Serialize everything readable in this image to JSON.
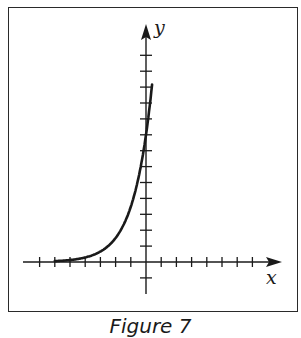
{
  "figure": {
    "caption": "Figure 7",
    "x_axis_label": "x",
    "y_axis_label": "y"
  },
  "colors": {
    "ink": "#1a1a1a",
    "frame": "#2a2a2a",
    "background": "#ffffff"
  },
  "chart_data": {
    "type": "line",
    "title": "",
    "caption": "Figure 7",
    "xlabel": "x",
    "ylabel": "y",
    "xlim": [
      -7,
      7
    ],
    "ylim": [
      -1,
      13
    ],
    "x_ticks": [
      -7,
      -6,
      -5,
      -4,
      -3,
      -2,
      -1,
      1,
      2,
      3,
      4,
      5,
      6,
      7
    ],
    "y_ticks": [
      -1,
      1,
      2,
      3,
      4,
      5,
      6,
      7,
      8,
      9,
      10,
      11,
      12,
      13
    ],
    "tick_labels_shown": false,
    "grid": false,
    "legend": null,
    "series": [
      {
        "name": "exponential growth curve",
        "description": "increasing exponential, approx y = 8 * 2.3^x, asymptotic to x-axis on the left",
        "x": [
          -6,
          -5,
          -4,
          -3,
          -2,
          -1,
          0,
          0.4
        ],
        "y": [
          0.05,
          0.1,
          0.3,
          0.7,
          1.5,
          3.5,
          8,
          12.4
        ]
      }
    ]
  }
}
